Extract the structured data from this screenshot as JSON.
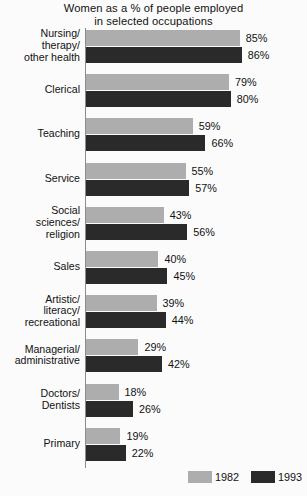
{
  "chart_data": {
    "type": "bar",
    "orientation": "horizontal",
    "title": "Women as a % of people employed in selected occupations",
    "title_lines": [
      "Women as a % of people employed",
      "in selected occupations"
    ],
    "xlabel": "",
    "ylabel": "",
    "xlim": [
      0,
      100
    ],
    "grid": false,
    "legend_position": "bottom-right",
    "value_suffix": "%",
    "categories": [
      "Nursing/ therapy/ other health",
      "Clerical",
      "Teaching",
      "Service",
      "Social sciences/ religion",
      "Sales",
      "Artistic/ literacy/ recreational",
      "Managerial/ administrative",
      "Doctors/ Dentists",
      "Primary"
    ],
    "category_lines": [
      [
        "Nursing/",
        "therapy/",
        "other health"
      ],
      [
        "Clerical"
      ],
      [
        "Teaching"
      ],
      [
        "Service"
      ],
      [
        "Social",
        "sciences/",
        "religion"
      ],
      [
        "Sales"
      ],
      [
        "Artistic/",
        "literacy/",
        "recreational"
      ],
      [
        "Managerial/",
        "administrative"
      ],
      [
        "Doctors/",
        "Dentists"
      ],
      [
        "Primary"
      ]
    ],
    "series": [
      {
        "name": "1982",
        "color": "#adadad",
        "values": [
          85,
          79,
          59,
          55,
          43,
          40,
          39,
          29,
          18,
          19
        ],
        "labels": [
          "85%",
          "79%",
          "59%",
          "55%",
          "43%",
          "40%",
          "39%",
          "29%",
          "18%",
          "19%"
        ]
      },
      {
        "name": "1993",
        "color": "#2a2a2a",
        "values": [
          86,
          80,
          66,
          57,
          56,
          45,
          44,
          42,
          26,
          22
        ],
        "labels": [
          "86%",
          "80%",
          "66%",
          "57%",
          "56%",
          "45%",
          "44%",
          "42%",
          "26%",
          "22%"
        ]
      }
    ]
  },
  "legend": {
    "entries": [
      {
        "label": "1982",
        "color": "#adadad"
      },
      {
        "label": "1993",
        "color": "#2a2a2a"
      }
    ]
  },
  "style": {
    "background": "#fbfbfb",
    "text_color": "#111111",
    "axis_color": "#8c8c8c"
  }
}
